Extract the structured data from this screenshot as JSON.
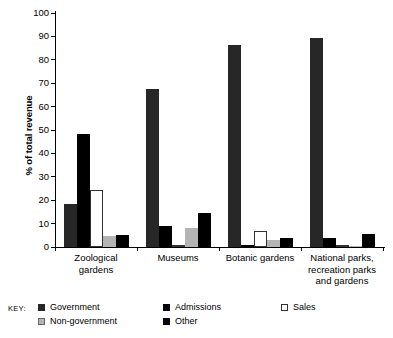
{
  "chart_data": {
    "type": "bar",
    "title": "",
    "subtitle": "",
    "xlabel": "",
    "ylabel": "% of total revenue",
    "ylim": [
      0,
      100
    ],
    "yticks": [
      0,
      10,
      20,
      30,
      40,
      50,
      60,
      70,
      80,
      90,
      100
    ],
    "grid": false,
    "legend_position": "bottom-left",
    "legend_prefix": "KEY:",
    "categories": [
      "Zoological gardens",
      "Museums",
      "Botanic gardens",
      "National parks, recreation parks and  gardens"
    ],
    "series": [
      {
        "name": "Government",
        "color": "#272727",
        "values": [
          18.5,
          67.5,
          86.5,
          89.5
        ]
      },
      {
        "name": "Admissions",
        "color": "#000000",
        "values": [
          48.5,
          9.0,
          0.8,
          4.0
        ]
      },
      {
        "name": "Sales",
        "color": "#ffffff",
        "values": [
          24.5,
          0.0,
          7.0,
          1.0
        ]
      },
      {
        "name": "Non-government",
        "color": "#b4b4b4",
        "values": [
          4.5,
          8.0,
          3.0,
          0.4
        ]
      },
      {
        "name": "Other",
        "color": "#000000",
        "values": [
          5.0,
          14.5,
          4.0,
          5.5
        ]
      }
    ]
  },
  "axis": {
    "y_title": "% of total revenue",
    "tick_labels": [
      "0",
      "10",
      "20",
      "30",
      "40",
      "50",
      "60",
      "70",
      "80",
      "90",
      "100"
    ]
  },
  "groups": [
    {
      "label": "Zoological\ngardens"
    },
    {
      "label": "Museums"
    },
    {
      "label": "Botanic gardens"
    },
    {
      "label": "National parks,\nrecreation parks\nand  gardens"
    }
  ],
  "legend": {
    "key_label": "KEY:",
    "items": [
      {
        "label": "Government",
        "swatch": "s-government"
      },
      {
        "label": "Admissions",
        "swatch": "s-admissions"
      },
      {
        "label": "Sales",
        "swatch": "s-sales"
      },
      {
        "label": "Non-government",
        "swatch": "s-nongovernment"
      },
      {
        "label": "Other",
        "swatch": "s-other"
      }
    ]
  }
}
